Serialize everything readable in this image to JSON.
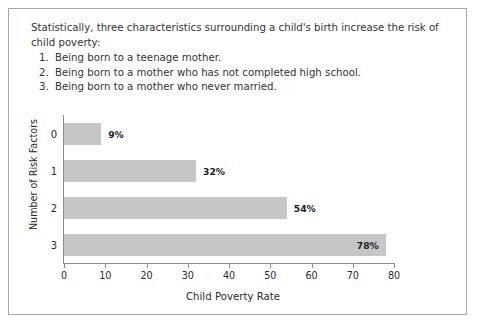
{
  "caption": {
    "lead": "Statistically, three characteristics surrounding a child's birth increase the risk of child poverty:",
    "items": [
      {
        "num": "1.",
        "text": "Being born to a teenage mother."
      },
      {
        "num": "2.",
        "text": "Being born to a mother who has not completed high school."
      },
      {
        "num": "3.",
        "text": "Being born to a mother who never married."
      }
    ]
  },
  "chart_data": {
    "type": "bar",
    "orientation": "horizontal",
    "title": "",
    "xlabel": "Child Poverty Rate",
    "ylabel": "Number of Risk Factors",
    "categories": [
      "0",
      "1",
      "2",
      "3"
    ],
    "values": [
      9,
      32,
      54,
      78
    ],
    "data_labels": [
      "9%",
      "32%",
      "54%",
      "78%"
    ],
    "label_placement": [
      "outside",
      "outside",
      "outside",
      "inside"
    ],
    "xlim": [
      0,
      80
    ],
    "xticks": [
      0,
      10,
      20,
      30,
      40,
      50,
      60,
      70,
      80
    ],
    "xtick_labels": [
      "0",
      "10",
      "20",
      "30",
      "40",
      "50",
      "60",
      "70",
      "80"
    ],
    "grid": false,
    "legend": false,
    "bar_color": "#c6c6c6",
    "axis_color": "#8c8c8c",
    "frame_color": "#a8a8a8",
    "background": "#ffffff"
  }
}
